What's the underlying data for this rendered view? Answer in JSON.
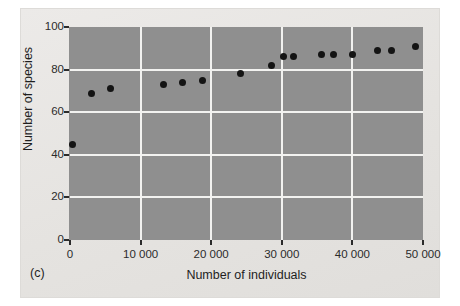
{
  "figure": {
    "panel_tag": "(c)",
    "background_color": "#e9e8e6",
    "plot_background_color": "#8f8f8f",
    "gridline_color": "#f2f2f0",
    "point_color": "#141414"
  },
  "chart_data": {
    "type": "scatter",
    "title": "",
    "xlabel": "Number of individuals",
    "ylabel": "Number of species",
    "xlim": [
      0,
      50000
    ],
    "ylim": [
      0,
      100
    ],
    "grid": true,
    "legend": "none",
    "xticks": [
      0,
      10000,
      20000,
      30000,
      40000,
      50000
    ],
    "xtick_labels": [
      "0",
      "10 000",
      "20 000",
      "30 000",
      "40 000",
      "50 000"
    ],
    "yticks": [
      0,
      20,
      40,
      60,
      80,
      100
    ],
    "ytick_labels": [
      "0",
      "20",
      "40",
      "60",
      "80",
      "100"
    ],
    "points": [
      {
        "x": 400,
        "y": 45
      },
      {
        "x": 3100,
        "y": 69
      },
      {
        "x": 5700,
        "y": 71
      },
      {
        "x": 13300,
        "y": 73
      },
      {
        "x": 16000,
        "y": 74
      },
      {
        "x": 18800,
        "y": 75
      },
      {
        "x": 24200,
        "y": 78
      },
      {
        "x": 28500,
        "y": 82
      },
      {
        "x": 30300,
        "y": 86
      },
      {
        "x": 31600,
        "y": 86
      },
      {
        "x": 35600,
        "y": 87
      },
      {
        "x": 37300,
        "y": 87
      },
      {
        "x": 40000,
        "y": 87
      },
      {
        "x": 43500,
        "y": 89
      },
      {
        "x": 45600,
        "y": 89
      },
      {
        "x": 48900,
        "y": 91
      }
    ]
  }
}
